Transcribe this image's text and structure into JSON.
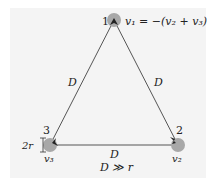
{
  "diagram": {
    "type": "equilateral triangle of three charges/vortices",
    "colors": {
      "background": "#f4f4f4",
      "line": "#555555",
      "node_fill": "#a8a8a8",
      "text": "#222222"
    },
    "nodes": [
      {
        "id": "1",
        "label": "1",
        "velocity_label": "v₁ = −(v₂ + v₃)",
        "cx": 114,
        "cy": 20
      },
      {
        "id": "2",
        "label": "2",
        "velocity_label": "v₂",
        "cx": 178,
        "cy": 145
      },
      {
        "id": "3",
        "label": "3",
        "velocity_label": "v₃",
        "cx": 50,
        "cy": 145
      }
    ],
    "edges": [
      {
        "from": "1",
        "to": "3",
        "label": "D"
      },
      {
        "from": "1",
        "to": "2",
        "label": "D"
      },
      {
        "from": "3",
        "to": "2",
        "label": "D"
      }
    ],
    "radius_label": "2r",
    "condition": "D ≫ r"
  }
}
